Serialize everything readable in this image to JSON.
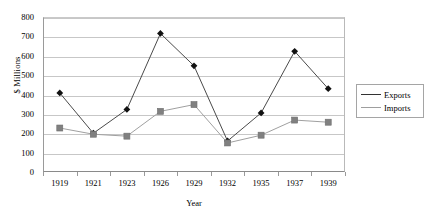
{
  "chart_data": {
    "type": "line",
    "title": "",
    "xlabel": "Year",
    "ylabel": "$ Millions",
    "categories": [
      "1919",
      "1921",
      "1923",
      "1926",
      "1929",
      "1932",
      "1935",
      "1937",
      "1939"
    ],
    "series": [
      {
        "name": "Exports",
        "color": "#333333",
        "marker": "diamond",
        "values": [
          408,
          200,
          323,
          715,
          548,
          160,
          305,
          623,
          430
        ]
      },
      {
        "name": "Imports",
        "color": "#808080",
        "marker": "square",
        "values": [
          227,
          195,
          185,
          313,
          348,
          150,
          190,
          268,
          257
        ]
      }
    ],
    "ylim": [
      0,
      800
    ],
    "ytick_step": 100,
    "yticks": [
      "0",
      "100",
      "200",
      "300",
      "400",
      "500",
      "600",
      "700",
      "800"
    ],
    "grid": true,
    "legend_position": "right"
  },
  "legend": {
    "entries": [
      {
        "label": "Exports"
      },
      {
        "label": "Imports"
      }
    ]
  },
  "colors": {
    "exports": "#333333",
    "imports": "#808080",
    "gridline": "#c7c7c7",
    "axis": "#8a8a8a",
    "background": "#ffffff"
  }
}
